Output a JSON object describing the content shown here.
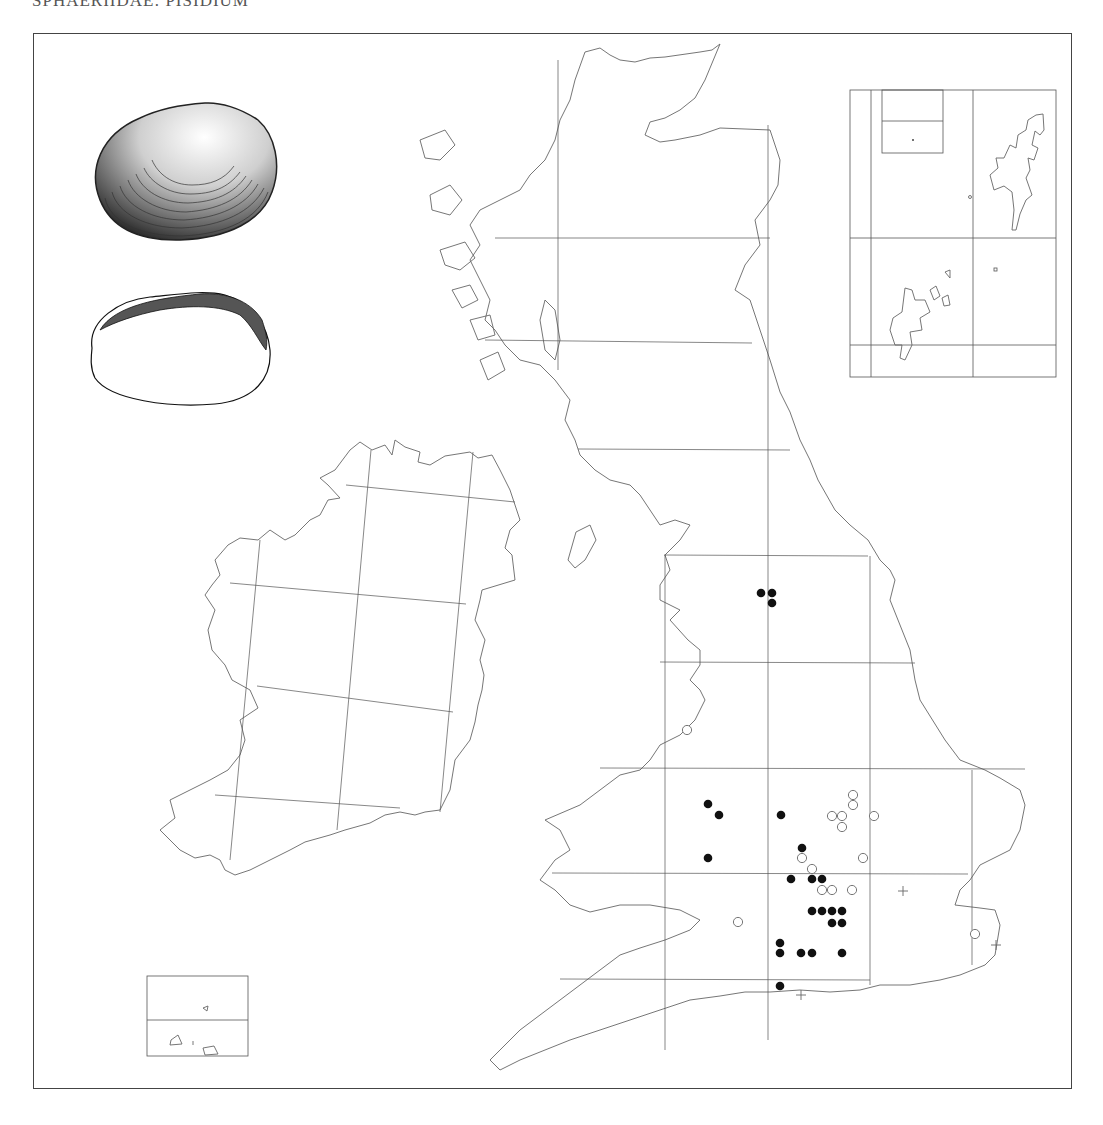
{
  "title": "SPHAERIIDAE: PISIDIUM",
  "frame": {
    "x": 33,
    "y": 33,
    "w": 1039,
    "h": 1056
  },
  "legend_symbols": {
    "filled_dot": "record post-1965",
    "open_dot": "record pre-1965",
    "cross": "doubtful / uncertain record"
  },
  "colors": {
    "coast": "#666666",
    "grid": "#555555",
    "dot": "#111111"
  },
  "illustrations": [
    {
      "name": "shell-exterior-icon",
      "x": 88,
      "y": 102,
      "w": 186,
      "h": 138
    },
    {
      "name": "shell-interior-icon",
      "x": 90,
      "y": 290,
      "w": 180,
      "h": 115
    }
  ],
  "insets": [
    {
      "name": "shetland-orkney-inset",
      "x": 850,
      "y": 90,
      "w": 206,
      "h": 287
    },
    {
      "name": "channel-islands-inset",
      "x": 147,
      "y": 976,
      "w": 101,
      "h": 80
    }
  ],
  "chart_data": {
    "type": "scatter",
    "title": "SPHAERIIDAE: PISIDIUM",
    "xlabel": "",
    "ylabel": "",
    "grid": true,
    "series": [
      {
        "name": "filled",
        "points": [
          [
            761,
            593
          ],
          [
            772,
            593
          ],
          [
            772,
            603
          ],
          [
            708,
            804
          ],
          [
            719,
            815
          ],
          [
            781,
            815
          ],
          [
            708,
            858
          ],
          [
            802,
            848
          ],
          [
            791,
            879
          ],
          [
            812,
            879
          ],
          [
            822,
            879
          ],
          [
            812,
            911
          ],
          [
            822,
            911
          ],
          [
            832,
            911
          ],
          [
            842,
            911
          ],
          [
            832,
            923
          ],
          [
            842,
            923
          ],
          [
            780,
            943
          ],
          [
            780,
            953
          ],
          [
            801,
            953
          ],
          [
            812,
            953
          ],
          [
            842,
            953
          ],
          [
            780,
            986
          ]
        ]
      },
      {
        "name": "open",
        "points": [
          [
            687,
            730
          ],
          [
            853,
            795
          ],
          [
            853,
            805
          ],
          [
            832,
            816
          ],
          [
            842,
            816
          ],
          [
            874,
            816
          ],
          [
            842,
            827
          ],
          [
            802,
            858
          ],
          [
            863,
            858
          ],
          [
            812,
            869
          ],
          [
            822,
            890
          ],
          [
            832,
            890
          ],
          [
            852,
            890
          ],
          [
            738,
            922
          ],
          [
            975,
            934
          ]
        ]
      },
      {
        "name": "cross",
        "points": [
          [
            903,
            891
          ],
          [
            996,
            945
          ],
          [
            801,
            995
          ]
        ]
      }
    ]
  }
}
